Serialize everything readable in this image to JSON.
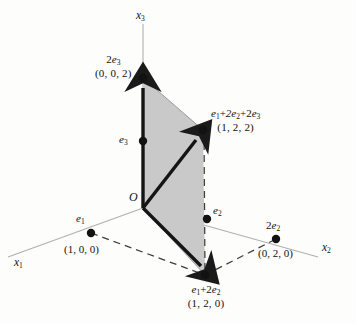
{
  "figure": {
    "background_color": "#fdfdfc",
    "shaded_region_color": "#c9c9c9",
    "vector_color": "#1a1a1a",
    "axis_color": "#a9a9a9",
    "dashed_color": "#4a4a4a",
    "point_color": "#121212"
  },
  "axes": [
    {
      "id": "x1",
      "name": "x-one-axis",
      "label": "x",
      "subscript": "1",
      "label_x": 14,
      "label_y": 258
    },
    {
      "id": "x2",
      "name": "x-two-axis",
      "label": "x",
      "subscript": "2",
      "label_x": 322,
      "label_y": 243
    },
    {
      "id": "x3",
      "name": "x-three-axis",
      "label": "x",
      "subscript": "3",
      "label_x": 136,
      "label_y": 10
    }
  ],
  "origin": {
    "label": "O",
    "x": 143,
    "y": 208,
    "label_x": 129,
    "label_y": 193
  },
  "points": [
    {
      "id": "e1",
      "name": "point-e1",
      "symbol": "e",
      "symbol_sub": "1",
      "coords": "(1, 0, 0)",
      "x": 91,
      "y": 233,
      "symbol_x": 77,
      "symbol_y": 212,
      "coords_x": 66,
      "coords_y": 243
    },
    {
      "id": "e2",
      "name": "point-e2",
      "symbol": "e",
      "symbol_sub": "2",
      "coords": "",
      "x": 207,
      "y": 219,
      "symbol_x": 212,
      "symbol_y": 203,
      "coords_x": 0,
      "coords_y": 0
    },
    {
      "id": "e3",
      "name": "point-e3",
      "symbol": "e",
      "symbol_sub": "3",
      "coords": "",
      "x": 143,
      "y": 141,
      "symbol_x": 122,
      "symbol_y": 133,
      "coords_x": 0,
      "coords_y": 0
    },
    {
      "id": "2e2",
      "name": "point-2e2",
      "symbol": "2e",
      "symbol_sub": "2",
      "coords": "(0, 2, 0)",
      "x": 276,
      "y": 239,
      "symbol_x": 268,
      "symbol_y": 219,
      "coords_x": 259,
      "coords_y": 248
    },
    {
      "id": "2e3",
      "name": "point-2e3",
      "symbol": "2e",
      "symbol_sub": "3",
      "coords": "(0, 0, 2)",
      "x": 143,
      "y": 78,
      "symbol_x": 101,
      "symbol_y": 55,
      "coords_x": 92,
      "coords_y": 68
    },
    {
      "id": "e1p2e2",
      "name": "point-e1-plus-2e2",
      "symbol": "e",
      "symbol_sub": "1",
      "symbol_rest": "+ 2e",
      "symbol_rest_sub": "2",
      "coords": "(1, 2, 0)",
      "x": 205,
      "y": 275,
      "symbol_x": 177,
      "symbol_y": 282,
      "coords_x": 180,
      "coords_y": 297
    },
    {
      "id": "e1p2e2p2e3",
      "name": "point-e1-plus-2e2-plus-2e3",
      "symbol": "e",
      "symbol_sub": "1",
      "coords": "(1, 2, 2)",
      "x": 203,
      "y": 130,
      "symbol_x": 212,
      "symbol_y": 110,
      "coords_x": 228,
      "coords_y": 125
    }
  ],
  "labels": {
    "e1_sym": "e",
    "e2_sym": "e",
    "e3_sym": "e",
    "two_e2_sym": "2e",
    "two_e3_sym": "2e",
    "e1_coords": "(1, 0, 0)",
    "two_e2_coords": "(0, 2, 0)",
    "two_e3_coords": "(0, 0, 2)",
    "sum_xy_coords": "(1, 2, 0)",
    "sum_xyz_coords": "(1, 2, 2)",
    "plus": "+",
    "sub1": "1",
    "sub2": "2",
    "sub3": "3",
    "origin": "O",
    "axis_x": "x"
  },
  "vectors": [
    {
      "name": "vector-2e3",
      "from": "origin",
      "to": "2e3",
      "style": "solid-arrow"
    },
    {
      "name": "vector-e1-plus-2e2",
      "from": "origin",
      "to": "e1p2e2",
      "style": "solid-arrow"
    },
    {
      "name": "vector-sum",
      "from": "origin",
      "to": "e1p2e2p2e3",
      "style": "solid-arrow"
    }
  ],
  "dashed_edges": [
    {
      "name": "dashed-e1-to-e1plus2e2"
    },
    {
      "name": "dashed-e1plus2e2-to-2e2"
    },
    {
      "name": "dashed-vertical-sum"
    }
  ],
  "shaded_polygon": {
    "name": "shaded-parallelogram",
    "vertices": "143,208 143,78 203,130 205,275"
  }
}
